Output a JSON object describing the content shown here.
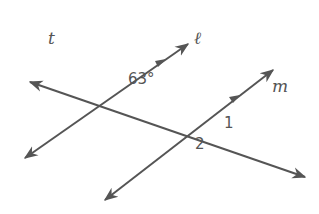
{
  "diagram": {
    "type": "parallel lines cut by a transversal",
    "line_color": "#555555",
    "lines": [
      {
        "name": "t",
        "label": "t",
        "role": "transversal"
      },
      {
        "name": "l",
        "label": "ℓ",
        "role": "parallel line",
        "parallel_marker": true
      },
      {
        "name": "m",
        "label": "m",
        "role": "parallel line",
        "parallel_marker": true
      }
    ],
    "angles": [
      {
        "label": "63°",
        "location": "intersection of t and ℓ, angle above t, right of ℓ"
      },
      {
        "label": "1",
        "location": "intersection of t and m, angle above t, right of m"
      },
      {
        "label": "2",
        "location": "intersection of t and m, angle below t, left of m"
      }
    ]
  }
}
